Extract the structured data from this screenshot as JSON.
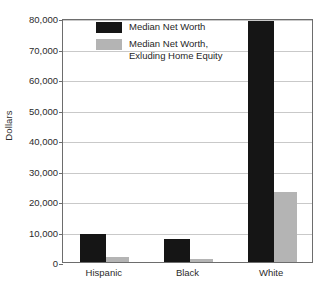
{
  "chart_data": {
    "type": "bar",
    "title": "",
    "xlabel": "",
    "ylabel": "Dollars",
    "categories": [
      "Hispanic",
      "Black",
      "White"
    ],
    "series": [
      {
        "name": "Median Net Worth",
        "color": "#151515",
        "values": [
          9200,
          7500,
          79000
        ]
      },
      {
        "name": "Median Net Worth, Exluding Home Equity",
        "color": "#b4b4b4",
        "values": [
          1500,
          1100,
          22800
        ]
      }
    ],
    "ylim": [
      0,
      80000
    ],
    "yticks": [
      0,
      10000,
      20000,
      30000,
      40000,
      50000,
      60000,
      70000,
      80000
    ],
    "ytick_labels": [
      "0",
      "10,000",
      "20,000",
      "30,000",
      "40,000",
      "50,000",
      "60,000",
      "70,000",
      "80,000"
    ],
    "grid": true,
    "legend_position": "upper-left-inside"
  },
  "legend": {
    "entries": [
      {
        "label": "Median Net Worth",
        "swatch": "dark"
      },
      {
        "label": "Median Net Worth,\nExluding Home Equity",
        "swatch": "light"
      }
    ]
  },
  "axes": {
    "y_title": "Dollars"
  }
}
